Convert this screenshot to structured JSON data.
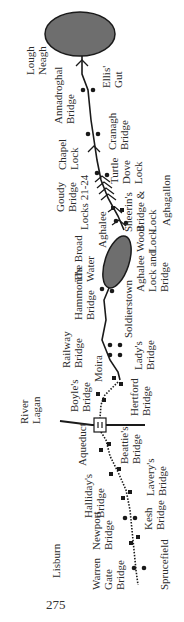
{
  "map": {
    "title": "Lagan Navigation route map (Lisburn to Lough Neagh)",
    "colors": {
      "water": "#6e6e6e",
      "line": "#1a1a1a",
      "text": "#2b2b2b",
      "background": "#ffffff"
    },
    "labels": {
      "lough_neagh": "Lough\nNeagh",
      "ellis_gut": "Ellis'\nGut",
      "annadroghal_bridge": "Annadroghal\nBridge",
      "cranagh_bridge": "Cranagh\nBridge",
      "chapel_lock": "Chapel\nLock",
      "turtle_dove_lock": "Turtle\nDove\nLock",
      "goudy_bridge": "Goudy\nBridge",
      "locks_21_24": "Locks 21-24",
      "sheerins_bridge_lock": "Sheerin's\nBridge &\nLock",
      "aghagallon": "Aghagallon",
      "aghalee": "Aghalee",
      "wood_lock": "Wood\nLock",
      "the_broad_water": "The Broad\nWater",
      "aghalee_lock_bridge": "Aghalee\nLock and\nBridge",
      "hammonds_bridge": "Hammond's\nBridge",
      "soldierstown": "Soldierstown",
      "railway_bridge": "Railway\nBridge",
      "ladys_bridge": "Lady's\nBridge",
      "moira": "Moira",
      "boyles_bridge": "Boyle's\nBridge",
      "hertford_bridge": "Hertford\nBridge",
      "river_lagan": "River\nLagan",
      "aqueduct": "Aqueduct",
      "beatties_bridge": "Beattie's\nBridge",
      "hallidays_bridge": "Halliday's\nBridge",
      "laverys_bridge": "Lavery's\nBridge",
      "newport_bridge": "Newport\nBridge",
      "kesh_bridge": "Kesh\nBridge",
      "lisburn": "Lisburn",
      "warren_gate_bridge": "Warren\nGate\nBridge",
      "sprucefield": "Sprucefield"
    },
    "page_number": "275"
  }
}
